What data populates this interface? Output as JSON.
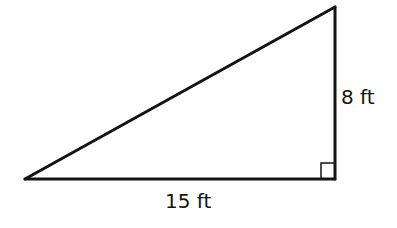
{
  "diagram": {
    "type": "right-triangle",
    "stroke_color": "#141414",
    "background_color": "#ffffff",
    "vertices": {
      "left": [
        25,
        179
      ],
      "right_angle": [
        335,
        179
      ],
      "top": [
        335,
        7
      ]
    },
    "right_angle_marker_size": 14,
    "labels": {
      "height": "8 ft",
      "base": "15 ft"
    }
  }
}
